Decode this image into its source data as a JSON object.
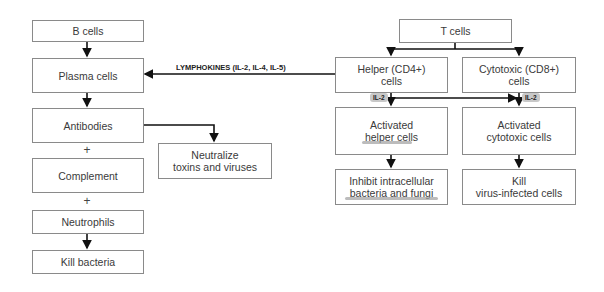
{
  "b_branch": {
    "b_cells": "B cells",
    "plasma_cells": "Plasma cells",
    "antibodies": "Antibodies",
    "plus1": "+",
    "complement": "Complement",
    "plus2": "+",
    "neutrophils": "Neutrophils",
    "kill_bacteria": "Kill bacteria",
    "neutralize_line1": "Neutralize",
    "neutralize_line2": "toxins and viruses"
  },
  "lymphokines_label": "LYMPHOKINES (IL-2, IL-4, IL-5)",
  "t_branch": {
    "t_cells": "T cells",
    "helper_line1": "Helper (CD4+)",
    "helper_line2": "cells",
    "cytotoxic_line1": "Cytotoxic (CD8+)",
    "cytotoxic_line2": "cells",
    "il2_left": "IL-2",
    "il2_right": "IL-2",
    "activated_helper_line1": "Activated",
    "activated_helper_line2": "helper cells",
    "activated_cytotoxic_line1": "Activated",
    "activated_cytotoxic_line2": "cytotoxic cells",
    "inhibit_line1": "Inhibit intracellular",
    "inhibit_line2": "bacteria and fungi",
    "kill_virus_line1": "Kill",
    "kill_virus_line2": "virus-infected cells"
  }
}
